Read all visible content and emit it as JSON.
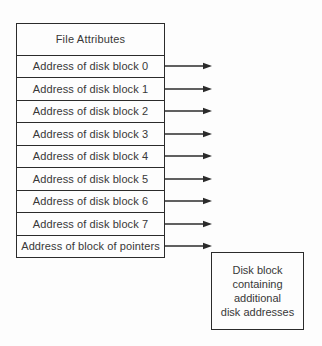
{
  "diagram": {
    "title": "File Attributes",
    "rows": [
      "Address of disk block 0",
      "Address of disk block 1",
      "Address of disk block 2",
      "Address of disk block 3",
      "Address of disk block 4",
      "Address of disk block 5",
      "Address of disk block 6",
      "Address of disk block 7",
      "Address of block of pointers"
    ],
    "side_box": {
      "text": "Disk block\ncontaining\nadditional\ndisk addresses"
    },
    "colors": {
      "line": "#2b2b2b",
      "text": "#383838",
      "bg": "#fdfdfd"
    }
  }
}
